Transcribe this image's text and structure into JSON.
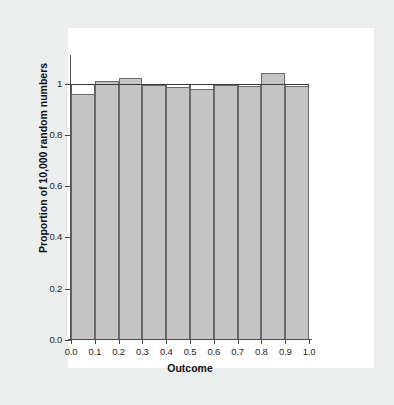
{
  "figure": {
    "background_color": "#eceded",
    "canvas_color": "#ffffff",
    "bar_fill_color": "#c4c4c4",
    "bar_edge_color": "#6a6a6a",
    "reference_line_color": "#3a3a3a",
    "axis_color": "#4a4a4a"
  },
  "chart_data": {
    "type": "bar",
    "title": "",
    "subtitle": "",
    "xlabel": "Outcome",
    "ylabel": "Proportion of 10,000 random numbers",
    "xlim": [
      0.0,
      1.0
    ],
    "ylim": [
      0.0,
      1.08
    ],
    "grid": false,
    "legend": null,
    "x_tick_labels": [
      "0.0",
      "0.1",
      "0.2",
      "0.3",
      "0.4",
      "0.5",
      "0.6",
      "0.7",
      "0.8",
      "0.9",
      "1.0"
    ],
    "x_tick_values": [
      0.0,
      0.1,
      0.2,
      0.3,
      0.4,
      0.5,
      0.6,
      0.7,
      0.8,
      0.9,
      1.0
    ],
    "y_tick_labels": [
      "0.0",
      "0.2",
      "0.4",
      "0.6",
      "0.8",
      "1"
    ],
    "y_tick_values": [
      0.0,
      0.2,
      0.4,
      0.6,
      0.8,
      1.0
    ],
    "bin_edges": [
      0.0,
      0.1,
      0.2,
      0.3,
      0.4,
      0.5,
      0.6,
      0.7,
      0.8,
      0.9,
      1.0
    ],
    "categories": [
      "0.0-0.1",
      "0.1-0.2",
      "0.2-0.3",
      "0.3-0.4",
      "0.4-0.5",
      "0.5-0.6",
      "0.6-0.7",
      "0.7-0.8",
      "0.8-0.9",
      "0.9-1.0"
    ],
    "values": [
      0.96,
      1.01,
      1.02,
      0.995,
      0.985,
      0.98,
      0.995,
      0.99,
      1.04,
      0.99
    ],
    "expected_values": [
      1.0,
      1.0,
      1.0,
      1.0,
      1.0,
      1.0,
      1.0,
      1.0,
      1.0,
      1.0
    ],
    "reference_line": {
      "y": 1.0,
      "label": ""
    },
    "annotations": []
  }
}
